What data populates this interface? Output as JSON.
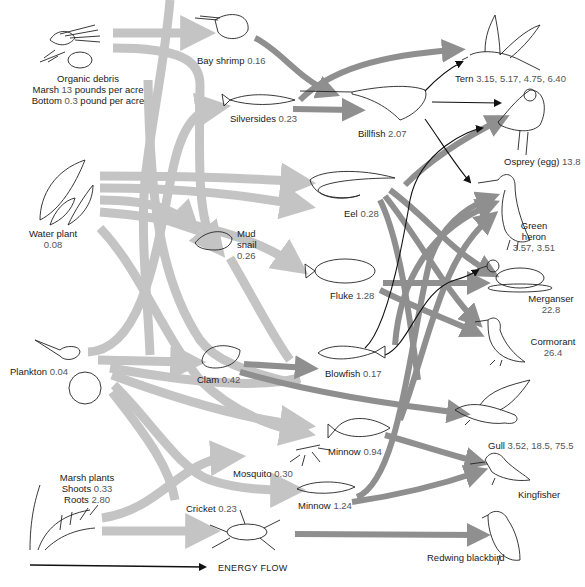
{
  "diagram": {
    "legend": {
      "energy_flow_label": "ENERGY FLOW"
    },
    "colors": {
      "light_arrow": "#c4c4c4",
      "dark_arrow": "#8f8f8f",
      "line_arrow": "#111111",
      "text": "#1a1a1a",
      "value_text": "#555555"
    },
    "nodes": {
      "organic_debris": {
        "name": "Organic debris",
        "line2_label": "Marsh",
        "line2_value": "13",
        "line2_unit": "pounds per acre",
        "line3_label": "Bottom",
        "line3_value": "0.3",
        "line3_unit": "pound  per acre"
      },
      "water_plant": {
        "name": "Water plant",
        "value": "0.08"
      },
      "plankton": {
        "name": "Plankton",
        "value": "0.04"
      },
      "marsh_plants": {
        "name": "Marsh plants",
        "shoots_label": "Shoots",
        "shoots_value": "0.33",
        "roots_label": "Roots",
        "roots_value": "2.80"
      },
      "bay_shrimp": {
        "name": "Bay shrimp",
        "value": "0.16"
      },
      "silversides": {
        "name": "Silversides",
        "value": "0.23"
      },
      "billfish": {
        "name": "Billfish",
        "value": "2.07"
      },
      "mud_snail": {
        "name1": "Mud",
        "name2": "snail",
        "value": "0.26"
      },
      "eel": {
        "name": "Eel",
        "value": "0.28"
      },
      "fluke": {
        "name": "Fluke",
        "value": "1.28"
      },
      "clam": {
        "name": "Clam",
        "value": "0.42"
      },
      "blowfish": {
        "name": "Blowfish",
        "value": "0.17"
      },
      "minnow_a": {
        "name": "Minnow",
        "value": "0.94"
      },
      "mosquito": {
        "name": "Mosquito",
        "value": "0.30"
      },
      "minnow_b": {
        "name": "Minnow",
        "value": "1.24"
      },
      "cricket": {
        "name": "Cricket",
        "value": "0.23"
      },
      "tern": {
        "name": "Tern",
        "value": "3.15, 5.17, 4.75, 6.40"
      },
      "osprey": {
        "name": "Osprey (egg)",
        "value": "13.8"
      },
      "green_heron": {
        "name1": "Green",
        "name2": "heron",
        "value": "3.57, 3.51"
      },
      "merganser": {
        "name": "Merganser",
        "value": "22.8"
      },
      "cormorant": {
        "name": "Cormorant",
        "value": "26.4"
      },
      "gull": {
        "name": "Gull",
        "value": "3.52, 18.5, 75.5"
      },
      "kingfisher": {
        "name": "Kingfisher"
      },
      "redwing_blackbird": {
        "name": "Redwing blackbird"
      }
    }
  }
}
